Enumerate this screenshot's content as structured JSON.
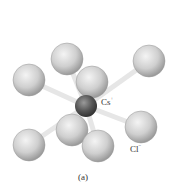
{
  "figure": {
    "caption": "(a)",
    "center_ion": {
      "symbol": "Cs",
      "charge": "+"
    },
    "corner_ion": {
      "symbol": "Cl",
      "charge": "−"
    },
    "colors": {
      "chloride": "#d0d0d0",
      "cesium": "#555555",
      "bond": "#e0e0e0"
    }
  }
}
